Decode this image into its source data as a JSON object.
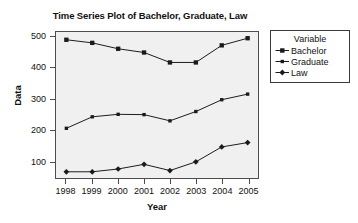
{
  "chart_data": {
    "type": "line",
    "title": "Time Series Plot of Bachelor, Graduate, Law",
    "xlabel": "Year",
    "ylabel": "Data",
    "categories": [
      "1998",
      "1999",
      "2000",
      "2001",
      "2002",
      "2003",
      "2004",
      "2005"
    ],
    "x": [
      1998,
      1999,
      2000,
      2001,
      2002,
      2003,
      2004,
      2005
    ],
    "xlim": [
      1997.6,
      2005.4
    ],
    "ylim": [
      45,
      515
    ],
    "yticks": [
      100,
      200,
      300,
      400,
      500
    ],
    "ytick_labels": [
      "100",
      "200",
      "300",
      "400",
      "500"
    ],
    "grid": false,
    "legend_position": "right",
    "legend_title": "Variable",
    "series": [
      {
        "name": "Bachelor",
        "marker": "filled-square",
        "color": "#1a1a1a",
        "values": [
          490,
          480,
          461,
          449,
          417,
          417,
          472,
          495
        ]
      },
      {
        "name": "Graduate",
        "marker": "filled-square-small",
        "color": "#1a1a1a",
        "values": [
          205,
          242,
          250,
          249,
          229,
          259,
          297,
          315
        ]
      },
      {
        "name": "Law",
        "marker": "filled-diamond",
        "color": "#1a1a1a",
        "values": [
          65,
          65,
          74,
          89,
          69,
          97,
          145,
          159
        ]
      }
    ]
  },
  "legend": {
    "title": "Variable",
    "items": [
      {
        "label": "Bachelor",
        "marker": "filled-square"
      },
      {
        "label": "Graduate",
        "marker": "filled-square-small"
      },
      {
        "label": "Law",
        "marker": "filled-diamond"
      }
    ]
  },
  "colors": {
    "plot_background": "#f0f0f0",
    "frame": "#4d4d4d",
    "series": "#1a1a1a",
    "page_background": "#ffffff",
    "text": "#111111"
  }
}
